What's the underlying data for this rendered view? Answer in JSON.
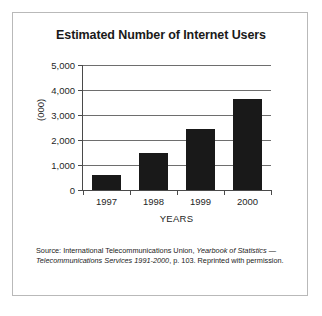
{
  "figure": {
    "title": "Estimated Number of Internet Users",
    "source_note": {
      "prefix": "Source: International Telecommunications Union,  ",
      "italic": "Yearbook of Statistics — Telecommunications Services 1991-2000",
      "suffix": ", p. 103. Reprinted with permission."
    }
  },
  "chart_data": {
    "type": "bar",
    "title": "Estimated Number of Internet Users",
    "categories": [
      "1997",
      "1998",
      "1999",
      "2000"
    ],
    "values": [
      600,
      1500,
      2450,
      3650
    ],
    "series": [
      {
        "name": "Internet Users (000)",
        "values": [
          600,
          1500,
          2450,
          3650
        ]
      }
    ],
    "xlabel": "YEARS",
    "ylabel": "(000)",
    "ylim": [
      0,
      5000
    ],
    "yticks": [
      0,
      1000,
      2000,
      3000,
      4000,
      5000
    ],
    "ytick_labels": [
      "0",
      "1,000",
      "2,000",
      "3,000",
      "4,000",
      "5,000"
    ],
    "grid": true,
    "legend": null,
    "bar_color": "#191919",
    "grid_color": "#6e6e6e",
    "axis_color": "#4a4a4a"
  }
}
